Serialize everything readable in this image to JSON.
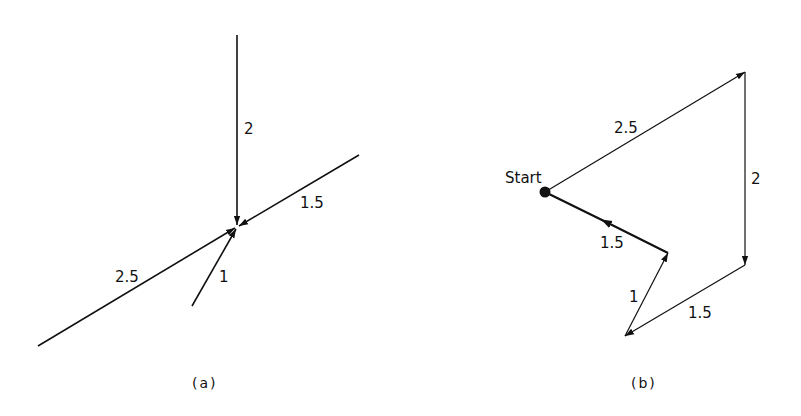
{
  "panel_a": {
    "caption": "(a)",
    "vectors": [
      {
        "label": "2",
        "magnitude": 2
      },
      {
        "label": "1.5",
        "magnitude": 1.5
      },
      {
        "label": "2.5",
        "magnitude": 2.5
      },
      {
        "label": "1",
        "magnitude": 1
      }
    ]
  },
  "panel_b": {
    "caption": "(b)",
    "start_label": "Start",
    "vectors": [
      {
        "label": "2.5",
        "magnitude": 2.5
      },
      {
        "label": "2",
        "magnitude": 2
      },
      {
        "label": "1.5",
        "magnitude": 1.5
      },
      {
        "label": "1",
        "magnitude": 1
      },
      {
        "label": "1.5",
        "magnitude": 1.5
      }
    ]
  },
  "colors": {
    "stroke": "#111111",
    "background": "#ffffff"
  }
}
